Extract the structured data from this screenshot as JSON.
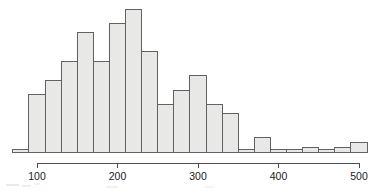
{
  "chart_data": {
    "type": "bar",
    "title": "",
    "subtitle": "",
    "xlabel": "",
    "ylabel": "",
    "grid": false,
    "legend": null,
    "bin_width": 20,
    "xlim": [
      70,
      510
    ],
    "ylim": [
      0,
      30
    ],
    "axis_ticks": [
      100,
      200,
      300,
      400,
      500
    ],
    "tick_labels": [
      "100",
      "200",
      "300",
      "400",
      "500"
    ],
    "bins": [
      {
        "start": 70,
        "end": 90,
        "count": 0
      },
      {
        "start": 90,
        "end": 110,
        "count": 12
      },
      {
        "start": 110,
        "end": 130,
        "count": 15
      },
      {
        "start": 130,
        "end": 150,
        "count": 19
      },
      {
        "start": 150,
        "end": 170,
        "count": 25
      },
      {
        "start": 170,
        "end": 190,
        "count": 19
      },
      {
        "start": 190,
        "end": 210,
        "count": 27
      },
      {
        "start": 210,
        "end": 230,
        "count": 30
      },
      {
        "start": 230,
        "end": 250,
        "count": 21
      },
      {
        "start": 250,
        "end": 270,
        "count": 10
      },
      {
        "start": 270,
        "end": 290,
        "count": 13
      },
      {
        "start": 290,
        "end": 310,
        "count": 16
      },
      {
        "start": 310,
        "end": 330,
        "count": 10
      },
      {
        "start": 330,
        "end": 350,
        "count": 8
      },
      {
        "start": 350,
        "end": 370,
        "count": 0
      },
      {
        "start": 370,
        "end": 390,
        "count": 3
      },
      {
        "start": 390,
        "end": 410,
        "count": 0
      },
      {
        "start": 410,
        "end": 430,
        "count": 0
      },
      {
        "start": 430,
        "end": 450,
        "count": 1
      },
      {
        "start": 450,
        "end": 470,
        "count": 0
      },
      {
        "start": 470,
        "end": 490,
        "count": 1
      },
      {
        "start": 490,
        "end": 510,
        "count": 2
      }
    ],
    "colors": {
      "bar_fill": "#e8e8e6",
      "bar_stroke": "#616161",
      "axis": "#4d4d4d",
      "text": "#1a1a1a",
      "background": "#ffffff"
    }
  }
}
